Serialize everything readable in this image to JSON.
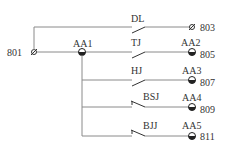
{
  "diagram": {
    "source_terminal": "801",
    "top_branch": {
      "switch": "DL",
      "terminal": "803"
    },
    "bus_node": "AA1",
    "branches": [
      {
        "switch": "TJ",
        "node": "AA2",
        "terminal": "805",
        "type": "NO"
      },
      {
        "switch": "HJ",
        "node": "AA3",
        "terminal": "807",
        "type": "NO"
      },
      {
        "switch": "BSJ",
        "node": "AA4",
        "terminal": "809",
        "type": "NC"
      },
      {
        "switch": "BJJ",
        "node": "AA5",
        "terminal": "811",
        "type": "NC"
      }
    ]
  },
  "colors": {
    "wire": "#8a8a8a",
    "ink": "#333333"
  }
}
